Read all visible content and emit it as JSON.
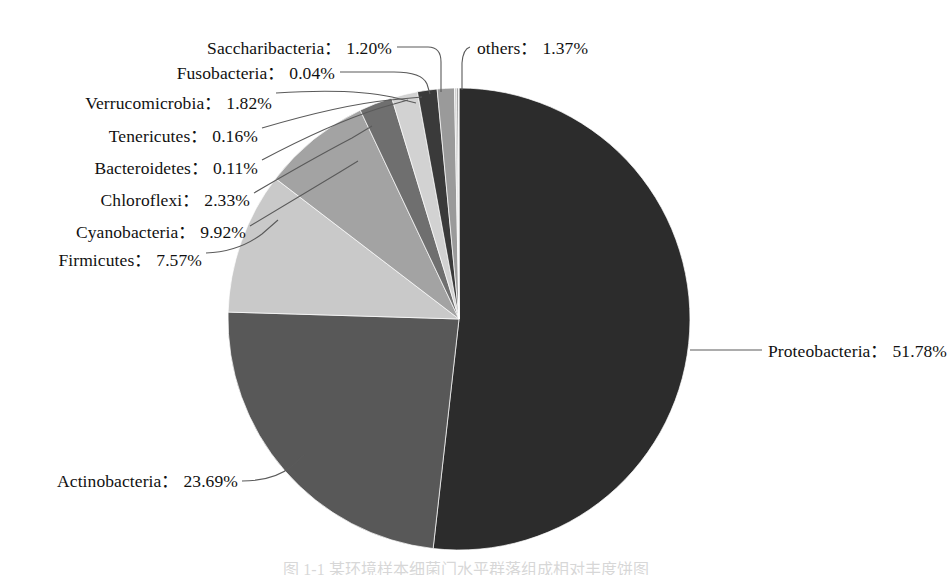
{
  "figure": {
    "caption": "图 1-1 某环境样本细菌门水平群落组成相对丰度饼图"
  },
  "chart_data": {
    "type": "pie",
    "title": "",
    "xlabel": "",
    "ylabel": "",
    "units": "%",
    "separator": "：",
    "legend": "none",
    "grid": false,
    "start_angle_deg": 0,
    "direction": "clockwise",
    "center": {
      "x": 459,
      "y": 319,
      "radius": 231
    },
    "categories": [
      "Proteobacteria",
      "Actinobacteria",
      "Cyanobacteria",
      "Firmicutes",
      "Chloroflexi",
      "Verrucomicrobia",
      "others",
      "Saccharibacteria",
      "Tenericutes",
      "Bacteroidetes",
      "Fusobacteria"
    ],
    "values": [
      51.78,
      23.69,
      9.92,
      7.57,
      2.33,
      1.82,
      1.37,
      1.2,
      0.16,
      0.11,
      0.04
    ],
    "colors": [
      "#2c2c2c",
      "#585858",
      "#c9c9c9",
      "#a3a3a3",
      "#6f6f6f",
      "#d2d2d2",
      "#3a3a3a",
      "#9a9a9a",
      "#cfcfcf",
      "#7d7d7d",
      "#b6b6b6"
    ],
    "slices": [
      {
        "name": "Proteobacteria",
        "value": 51.78,
        "label": "Proteobacteria",
        "percent": "51.78%",
        "color": "#2c2c2c"
      },
      {
        "name": "Actinobacteria",
        "value": 23.69,
        "label": "Actinobacteria",
        "percent": "23.69%",
        "color": "#585858"
      },
      {
        "name": "Cyanobacteria",
        "value": 9.92,
        "label": "Cyanobacteria",
        "percent": "9.92%",
        "color": "#c9c9c9"
      },
      {
        "name": "Firmicutes",
        "value": 7.57,
        "label": "Firmicutes",
        "percent": "7.57%",
        "color": "#a3a3a3"
      },
      {
        "name": "Chloroflexi",
        "value": 2.33,
        "label": "Chloroflexi",
        "percent": "2.33%",
        "color": "#6f6f6f"
      },
      {
        "name": "Verrucomicrobia",
        "value": 1.82,
        "label": "Verrucomicrobia",
        "percent": "1.82%",
        "color": "#d2d2d2"
      },
      {
        "name": "others",
        "value": 1.37,
        "label": "others",
        "percent": "1.37%",
        "color": "#3a3a3a"
      },
      {
        "name": "Saccharibacteria",
        "value": 1.2,
        "label": "Saccharibacteria",
        "percent": "1.20%",
        "color": "#9a9a9a"
      },
      {
        "name": "Tenericutes",
        "value": 0.16,
        "label": "Tenericutes",
        "percent": "0.16%",
        "color": "#cfcfcf"
      },
      {
        "name": "Bacteroidetes",
        "value": 0.11,
        "label": "Bacteroidetes",
        "percent": "0.11%",
        "color": "#7d7d7d"
      },
      {
        "name": "Fusobacteria",
        "value": 0.04,
        "label": "Fusobacteria",
        "percent": "0.04%",
        "color": "#b6b6b6"
      }
    ]
  },
  "labels": {
    "saccharibacteria": {
      "name": "Saccharibacteria",
      "sep": "：",
      "value": "1.20%"
    },
    "fusobacteria": {
      "name": "Fusobacteria",
      "sep": "：",
      "value": "0.04%"
    },
    "verrucomicrobia": {
      "name": "Verrucomicrobia",
      "sep": "：",
      "value": "1.82%"
    },
    "tenericutes": {
      "name": "Tenericutes",
      "sep": "：",
      "value": "0.16%"
    },
    "bacteroidetes": {
      "name": "Bacteroidetes",
      "sep": "：",
      "value": "0.11%"
    },
    "chloroflexi": {
      "name": "Chloroflexi",
      "sep": "：",
      "value": "2.33%"
    },
    "cyanobacteria": {
      "name": "Cyanobacteria",
      "sep": "：",
      "value": "9.92%"
    },
    "firmicutes": {
      "name": "Firmicutes",
      "sep": "：",
      "value": "7.57%"
    },
    "others": {
      "name": "others",
      "sep": "：",
      "value": "1.37%"
    },
    "proteobacteria": {
      "name": "Proteobacteria",
      "sep": "：",
      "value": "51.78%"
    },
    "actinobacteria": {
      "name": "Actinobacteria",
      "sep": "：",
      "value": "23.69%"
    }
  }
}
